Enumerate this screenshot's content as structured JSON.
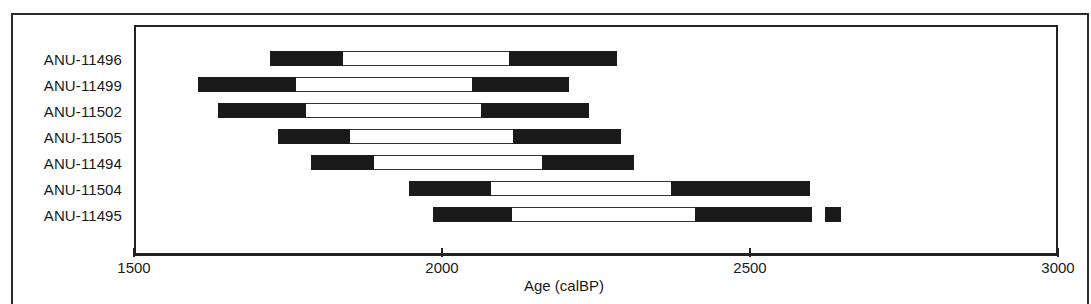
{
  "chart_data": {
    "type": "bar",
    "subtype": "radiocarbon-calibration-range-bars",
    "title": "",
    "xlabel": "Age (calBP)",
    "ylabel": "",
    "xlim": [
      1500,
      3000
    ],
    "xticks": [
      1500,
      2000,
      2500,
      3000
    ],
    "xtick_labels": [
      "1500",
      "2000",
      "2500",
      "3000"
    ],
    "grid": false,
    "legend": false,
    "categories": [
      "ANU-11496",
      "ANU-11499",
      "ANU-11502",
      "ANU-11505",
      "ANU-11494",
      "ANU-11504",
      "ANU-11495"
    ],
    "series": [
      {
        "name": "ANU-11496",
        "range_start": 1721,
        "range_end": 2284,
        "inner_start": 1840,
        "inner_end": 2108,
        "outliers": []
      },
      {
        "name": "ANU-11499",
        "range_start": 1604,
        "range_end": 2206,
        "inner_start": 1763,
        "inner_end": 2048,
        "outliers": []
      },
      {
        "name": "ANU-11502",
        "range_start": 1637,
        "range_end": 2238,
        "inner_start": 1780,
        "inner_end": 2063,
        "outliers": []
      },
      {
        "name": "ANU-11505",
        "range_start": 1734,
        "range_end": 2290,
        "inner_start": 1851,
        "inner_end": 2116,
        "outliers": []
      },
      {
        "name": "ANU-11494",
        "range_start": 1788,
        "range_end": 2312,
        "inner_start": 1889,
        "inner_end": 2162,
        "outliers": []
      },
      {
        "name": "ANU-11504",
        "range_start": 1946,
        "range_end": 2597,
        "inner_start": 2079,
        "inner_end": 2372,
        "outliers": []
      },
      {
        "name": "ANU-11495",
        "range_start": 1986,
        "range_end": 2601,
        "inner_start": 2113,
        "inner_end": 2410,
        "outliers": [
          {
            "start": 2622,
            "end": 2648
          }
        ]
      }
    ],
    "colors": {
      "bar_dark": "#1a1a1a",
      "bar_light": "#ffffff",
      "frame": "#222222",
      "text": "#1a1a1a",
      "background": "#ffffff"
    }
  }
}
